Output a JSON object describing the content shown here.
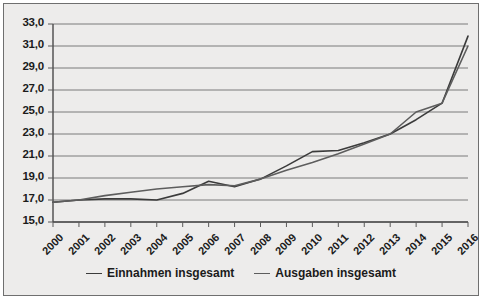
{
  "chart_data": {
    "type": "line",
    "title": "",
    "subtitle": "",
    "xlabel": "",
    "ylabel": "",
    "x": [
      2000,
      2001,
      2002,
      2003,
      2004,
      2005,
      2006,
      2007,
      2008,
      2009,
      2010,
      2011,
      2012,
      2013,
      2014,
      2015,
      2016
    ],
    "categories": [
      "2000",
      "2001",
      "2002",
      "2003",
      "2004",
      "2005",
      "2006",
      "2007",
      "2008",
      "2009",
      "2010",
      "2011",
      "2012",
      "2013",
      "2014",
      "2015",
      "2016"
    ],
    "ylim": [
      15.0,
      33.0
    ],
    "yticks": [
      15.0,
      17.0,
      19.0,
      21.0,
      23.0,
      25.0,
      27.0,
      29.0,
      31.0,
      33.0
    ],
    "ytick_labels": [
      "15,0",
      "17,0",
      "19,0",
      "21,0",
      "23,0",
      "25,0",
      "27,0",
      "29,0",
      "31,0",
      "33,0"
    ],
    "grid": true,
    "legend_position": "bottom",
    "series": [
      {
        "name": "Einnahmen insgesamt",
        "color": "#3b3b3b",
        "values": [
          16.8,
          17.0,
          17.1,
          17.1,
          17.0,
          17.6,
          18.7,
          18.2,
          18.9,
          20.1,
          21.4,
          21.5,
          22.2,
          23.0,
          24.3,
          25.8,
          31.9
        ]
      },
      {
        "name": "Ausgaben insgesamt",
        "color": "#5d5d5d",
        "values": [
          16.8,
          17.0,
          17.4,
          17.7,
          18.0,
          18.2,
          18.4,
          18.3,
          18.9,
          19.7,
          20.4,
          21.2,
          22.1,
          23.0,
          25.0,
          25.8,
          31.0
        ]
      }
    ]
  },
  "legend": {
    "items": [
      {
        "label": "Einnahmen insgesamt"
      },
      {
        "label": "Ausgaben insgesamt"
      }
    ]
  },
  "axes": {
    "y_tick_labels": [
      "33,0",
      "31,0",
      "29,0",
      "27,0",
      "25,0",
      "23,0",
      "21,0",
      "19,0",
      "17,0",
      "15,0"
    ],
    "x_tick_labels": [
      "2000",
      "2001",
      "2002",
      "2003",
      "2004",
      "2005",
      "2006",
      "2007",
      "2008",
      "2009",
      "2010",
      "2011",
      "2012",
      "2013",
      "2014",
      "2015",
      "2016"
    ]
  }
}
